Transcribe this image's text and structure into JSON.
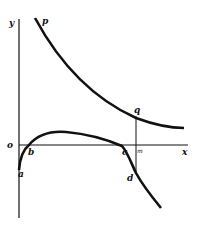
{
  "diagram": {
    "axes": {
      "y_label": "y",
      "x_label": "x",
      "origin_label": "o"
    },
    "curves": [
      {
        "id": "upper",
        "label": "p",
        "description": "decreasing hyperbola-like curve above the x-axis"
      },
      {
        "id": "lower",
        "description": "curve starting below origin at a, rising through b, peaking, descending through c and d"
      }
    ],
    "points": {
      "a": "a",
      "b": "b",
      "c": "c",
      "d": "d",
      "q": "q",
      "m": "m"
    },
    "colors": {
      "ink": "#111111",
      "background": "#ffffff"
    }
  }
}
